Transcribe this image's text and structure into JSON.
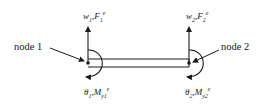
{
  "diagram": {
    "type": "beam-element-free-body",
    "colors": {
      "stroke": "#1a1a1a",
      "background": "#ffffff"
    },
    "nodes": [
      {
        "id": 1,
        "label": "node 1",
        "x": 88,
        "y": 63
      },
      {
        "id": 2,
        "label": "node 2",
        "x": 189,
        "y": 63
      }
    ],
    "beam": {
      "x1": 88,
      "x2": 189,
      "top": 59,
      "bottom": 67
    },
    "labels": {
      "node1": "node 1",
      "node2": "node 2",
      "force1": {
        "dof": "w",
        "dof_sub": "1",
        "sep": ",",
        "load": "F",
        "load_sub": "1",
        "load_sup": "e"
      },
      "force2": {
        "dof": "w",
        "dof_sub": "2",
        "sep": ",",
        "load": "F",
        "load_sub": "2",
        "load_sup": "e"
      },
      "moment1": {
        "dof": "θ",
        "dof_sub": "1",
        "sep": ",",
        "load": "M",
        "load_sub": "y1",
        "load_sup": "e"
      },
      "moment2": {
        "dof": "θ",
        "dof_sub": "2",
        "sep": ",",
        "load": "M",
        "load_sub": "y2",
        "load_sup": "e"
      }
    },
    "arrows": [
      {
        "kind": "vertical-force",
        "node": 1,
        "direction": "up"
      },
      {
        "kind": "vertical-force",
        "node": 2,
        "direction": "up"
      },
      {
        "kind": "moment",
        "node": 1,
        "direction": "clockwise"
      },
      {
        "kind": "moment",
        "node": 2,
        "direction": "clockwise"
      },
      {
        "kind": "pointer",
        "target": "node 1"
      },
      {
        "kind": "pointer",
        "target": "node 2"
      }
    ]
  }
}
